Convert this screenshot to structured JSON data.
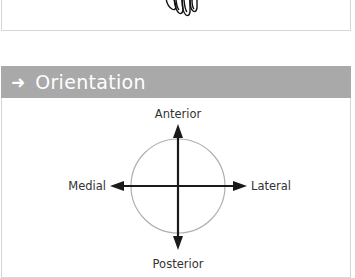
{
  "top_panel": {
    "illustration": "hand-fingertips-outline"
  },
  "section": {
    "icon": "arrow-right-icon",
    "arrow_glyph": "➜",
    "title": "Orientation",
    "header_color": "#a9a9a9"
  },
  "diagram": {
    "labels": {
      "top": "Anterior",
      "bottom": "Posterior",
      "left": "Medial",
      "right": "Lateral"
    },
    "circle_color": "#b0b0b0",
    "arrow_color": "#1a1a1a"
  }
}
